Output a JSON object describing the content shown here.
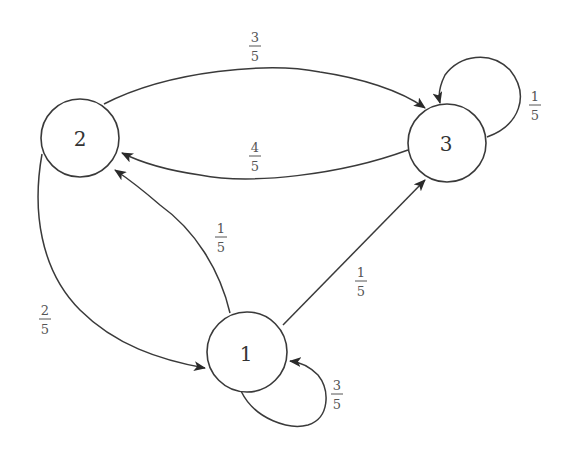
{
  "diagram": {
    "type": "markov-chain",
    "nodes": [
      {
        "id": "1",
        "label": "1"
      },
      {
        "id": "2",
        "label": "2"
      },
      {
        "id": "3",
        "label": "3"
      }
    ],
    "edges": [
      {
        "from": "2",
        "to": "3",
        "probability": {
          "num": "3",
          "den": "5"
        }
      },
      {
        "from": "3",
        "to": "2",
        "probability": {
          "num": "4",
          "den": "5"
        }
      },
      {
        "from": "3",
        "to": "3",
        "probability": {
          "num": "1",
          "den": "5"
        }
      },
      {
        "from": "1",
        "to": "2",
        "probability": {
          "num": "1",
          "den": "5"
        }
      },
      {
        "from": "1",
        "to": "3",
        "probability": {
          "num": "1",
          "den": "5"
        }
      },
      {
        "from": "2",
        "to": "1",
        "probability": {
          "num": "2",
          "den": "5"
        }
      },
      {
        "from": "1",
        "to": "1",
        "probability": {
          "num": "3",
          "den": "5"
        }
      }
    ]
  }
}
